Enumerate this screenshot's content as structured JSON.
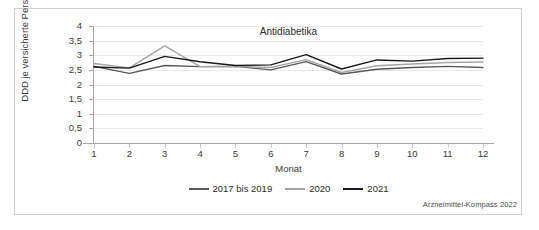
{
  "figure": {
    "source_note": "Arzneimittel-Kompass 2022"
  },
  "chart_data": {
    "type": "line",
    "title": "Antidiabetika",
    "xlabel": "Monat",
    "ylabel": "DDD je versicherte Person",
    "categories": [
      "1",
      "2",
      "3",
      "4",
      "5",
      "6",
      "7",
      "8",
      "9",
      "10",
      "11",
      "12"
    ],
    "x": [
      1,
      2,
      3,
      4,
      5,
      6,
      7,
      8,
      9,
      10,
      11,
      12
    ],
    "xlim": [
      1,
      12
    ],
    "ylim": [
      0,
      4
    ],
    "yticks": [
      0,
      0.5,
      1,
      1.5,
      2,
      2.5,
      3,
      3.5,
      4
    ],
    "ytick_labels": [
      "0",
      "0,5",
      "1",
      "1,5",
      "2",
      "2,5",
      "3",
      "3,5",
      "4"
    ],
    "grid": true,
    "legend_position": "bottom",
    "series": [
      {
        "name": "2017 bis 2019",
        "color": "#595959",
        "values": [
          2.62,
          2.38,
          2.65,
          2.61,
          2.62,
          2.5,
          2.78,
          2.36,
          2.52,
          2.58,
          2.62,
          2.58
        ]
      },
      {
        "name": "2020",
        "color": "#a6a6a6",
        "values": [
          2.72,
          2.57,
          3.32,
          2.61,
          2.62,
          2.58,
          2.85,
          2.41,
          2.64,
          2.7,
          2.75,
          2.77
        ]
      },
      {
        "name": "2021",
        "color": "#1a1a1a",
        "values": [
          2.6,
          2.56,
          2.96,
          2.78,
          2.65,
          2.67,
          3.02,
          2.53,
          2.84,
          2.8,
          2.89,
          2.9
        ]
      }
    ]
  }
}
